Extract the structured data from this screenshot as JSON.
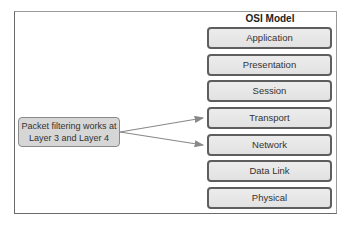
{
  "diagram": {
    "title": "OSI Model",
    "layers": [
      {
        "label": "Application"
      },
      {
        "label": "Presentation"
      },
      {
        "label": "Session"
      },
      {
        "label": "Transport"
      },
      {
        "label": "Network"
      },
      {
        "label": "Data Link"
      },
      {
        "label": "Physical"
      }
    ],
    "note": {
      "line1": "Packet filtering works at",
      "line2": "Layer 3 and Layer 4"
    },
    "arrows": [
      {
        "from": "note",
        "to": "Transport"
      },
      {
        "from": "note",
        "to": "Network"
      }
    ],
    "colors": {
      "layer_border": "#5e5e5e",
      "layer_fill": "#e6e6e6",
      "note_fill": "#d6d6d6",
      "arrow": "#888888"
    }
  }
}
